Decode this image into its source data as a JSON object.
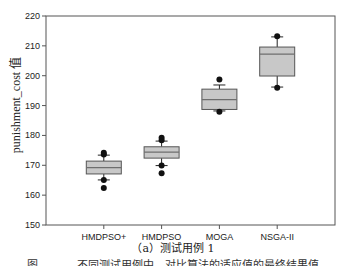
{
  "chart_data": {
    "type": "boxplot",
    "title": "",
    "xlabel": "",
    "ylabel": "punishment_cost 值",
    "ylim": [
      150,
      220
    ],
    "yticks": [
      150,
      160,
      170,
      180,
      190,
      200,
      210,
      220
    ],
    "grid": false,
    "legend": null,
    "categories": [
      "HMDPSO+",
      "HMDPSO",
      "MOGA",
      "NSGA-II"
    ],
    "series": [
      {
        "name": "HMDPSO+",
        "whisker_low": 165.1,
        "q1": 167.1,
        "median": 169.2,
        "q3": 171.4,
        "whisker_high": 173.4,
        "outliers": [
          162.4,
          165.1,
          173.6,
          174.2
        ]
      },
      {
        "name": "HMDPSO",
        "whisker_low": 169.9,
        "q1": 172.4,
        "median": 174.4,
        "q3": 176.2,
        "whisker_high": 178.1,
        "outliers": [
          167.3,
          169.9,
          178.4,
          179.2
        ]
      },
      {
        "name": "MOGA",
        "whisker_low": 188.2,
        "q1": 188.7,
        "median": 192.0,
        "q3": 195.5,
        "whisker_high": 196.9,
        "outliers": [
          187.9,
          198.7
        ]
      },
      {
        "name": "NSGA-II",
        "whisker_low": 196.2,
        "q1": 199.9,
        "median": 207.2,
        "q3": 209.6,
        "whisker_high": 213.0,
        "outliers": [
          196.0,
          213.2
        ]
      }
    ]
  },
  "figure": {
    "subcaption": "（a）测试用例 1",
    "cut_caption": "图 ．．．．．不同测试用例中，对比算法的适应值的最终结果值"
  },
  "style": {
    "box_fill": "#c8c8c8",
    "median_color": "#6e6e6e",
    "line_color": "#222222",
    "frame_color": "#555555"
  }
}
